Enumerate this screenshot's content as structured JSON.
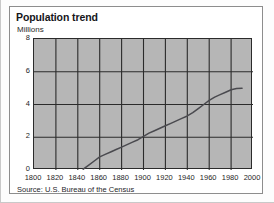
{
  "card": {
    "title": "Population trend",
    "source": "Source: U.S. Bureau of the Census"
  },
  "colors": {
    "plot_background": "#b6b6b6",
    "gridline": "#2b2b2b",
    "axis": "#1e1e1e",
    "series_line": "#4a4a4f",
    "card_background": "#ffffff",
    "card_border": "#8d8d8d",
    "title_text": "#16161a",
    "page_background": "#fdfdfd"
  },
  "chart_data": {
    "type": "line",
    "title": "Population trend",
    "subtitle": "",
    "xlabel": "",
    "ylabel": "Millions",
    "ylabel_position": "above-axis-left",
    "grid": true,
    "grid_x": true,
    "grid_y": true,
    "legend": false,
    "legend_position": "none",
    "xlim": [
      1800,
      2000
    ],
    "ylim": [
      0,
      8
    ],
    "xticks": [
      1800,
      1820,
      1840,
      1860,
      1880,
      1900,
      1920,
      1940,
      1960,
      1980,
      2000
    ],
    "xtick_labels": [
      "1800",
      "1820",
      "1840",
      "1860",
      "1880",
      "1900",
      "1920",
      "1940",
      "1960",
      "1980",
      "2000"
    ],
    "yticks": [
      0,
      2,
      4,
      6,
      8
    ],
    "ytick_labels": [
      "0",
      "2",
      "4",
      "6",
      "8"
    ],
    "x_tick_interval": 20,
    "y_tick_interval": 2,
    "series": [
      {
        "name": "Population",
        "units": "Millions",
        "x": [
          1845,
          1850,
          1855,
          1860,
          1865,
          1870,
          1875,
          1880,
          1885,
          1890,
          1895,
          1900,
          1905,
          1910,
          1915,
          1920,
          1925,
          1930,
          1935,
          1940,
          1945,
          1950,
          1955,
          1960,
          1965,
          1970,
          1975,
          1980,
          1985,
          1990
        ],
        "values": [
          0.05,
          0.3,
          0.55,
          0.8,
          0.95,
          1.1,
          1.25,
          1.4,
          1.55,
          1.7,
          1.85,
          2.05,
          2.25,
          2.4,
          2.55,
          2.7,
          2.85,
          3.0,
          3.15,
          3.3,
          3.5,
          3.75,
          4.0,
          4.25,
          4.45,
          4.6,
          4.75,
          4.9,
          4.98,
          5.0
        ]
      }
    ],
    "annotations": []
  }
}
